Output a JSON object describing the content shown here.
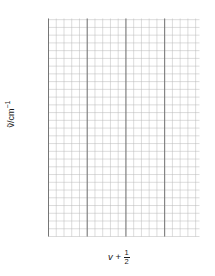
{
  "figure": {
    "kind": "birge-sponer-plot",
    "background": "#ffffff",
    "ink": "#1a1a1a"
  },
  "axes": {
    "y_label_prefix": "ṽ/cm",
    "y_label_exponent": "−1",
    "y_ticks": [
      "0",
      "500",
      "1000",
      "1500",
      "2000",
      "2500"
    ],
    "y_tick_values": [
      0,
      500,
      1000,
      1500,
      2000,
      2500
    ],
    "x_title_symbol": "v",
    "x_title_plus": " + ",
    "x_ticks": [
      {
        "num": "1",
        "den": "2"
      },
      {
        "num": "3",
        "den": "2"
      },
      {
        "num": "39",
        "den": "2"
      }
    ]
  },
  "style": {
    "grid_minor_color": "#b9b9b9",
    "grid_major_color": "#6a6a6a",
    "axis_color": "#4d4d4d",
    "fill_color": "#bdbdbd",
    "fill_opacity": 0.55,
    "line_color": "#6f6f6f",
    "marker_face": "#ffffff",
    "marker_edge": "#7a7a7a"
  },
  "chart_data": {
    "type": "scatter",
    "title": "",
    "xlabel": "v + 1/2",
    "ylabel": "ṽ/cm⁻¹",
    "xlim": [
      0.5,
      19.5
    ],
    "ylim": [
      0,
      2700
    ],
    "grid": true,
    "legend": "none",
    "shaded_area_under_line": true,
    "fit_line": {
      "x": [
        0.5,
        19.5
      ],
      "y": [
        2180,
        0
      ]
    },
    "x": [
      0.5,
      1.5,
      2.5,
      3.5,
      4.5,
      5.5,
      6.5,
      7.5,
      8.5,
      9.5,
      10.5,
      11.5,
      12.5,
      13.5,
      14.5,
      15.5,
      16.5,
      17.5,
      18.5
    ],
    "y": [
      2180,
      2060,
      1950,
      1870,
      1760,
      1630,
      1500,
      1400,
      1280,
      1160,
      1030,
      930,
      830,
      760,
      670,
      620,
      540,
      430,
      300
    ],
    "x_tick_labels": [
      "1/2",
      "3/2",
      "39/2"
    ],
    "y_tick_labels": [
      "0",
      "500",
      "1000",
      "1500",
      "2000",
      "2500"
    ]
  }
}
